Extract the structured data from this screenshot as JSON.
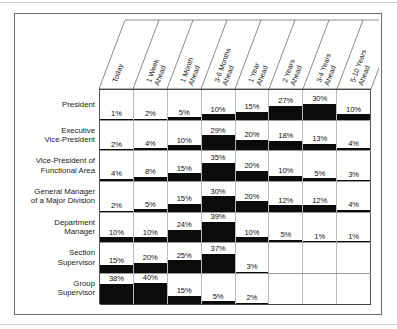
{
  "chart_data": {
    "type": "bar",
    "title": "",
    "xlabel": "",
    "ylabel": "",
    "grid": true,
    "legend": "none",
    "unit": "%",
    "ylim": [
      0,
      40
    ],
    "categories": [
      "Today",
      "1 Week Ahead",
      "1 Month Ahead",
      "3-6 Months Ahead",
      "1 Year Ahead",
      "2 Years Ahead",
      "3-4 Years Ahead",
      "5-10 Years Ahead"
    ],
    "series": [
      {
        "name": "President",
        "values": [
          1,
          2,
          5,
          10,
          15,
          27,
          30,
          10
        ],
        "labels": [
          "1%",
          "2%",
          "5%",
          "10%",
          "15%",
          "27%",
          "30%",
          "10%"
        ]
      },
      {
        "name": "Executive Vice-President",
        "values": [
          2,
          4,
          10,
          29,
          20,
          18,
          13,
          4
        ],
        "labels": [
          "2%",
          "4%",
          "10%",
          "29%",
          "20%",
          "18%",
          "13%",
          "4%"
        ]
      },
      {
        "name": "Vice-President of Functional Area",
        "values": [
          4,
          8,
          15,
          35,
          20,
          10,
          5,
          3
        ],
        "labels": [
          "4%",
          "8%",
          "15%",
          "35%",
          "20%",
          "10%",
          "5%",
          "3%"
        ]
      },
      {
        "name": "General Manager of a Major Division",
        "values": [
          2,
          5,
          15,
          30,
          20,
          12,
          12,
          4
        ],
        "labels": [
          "2%",
          "5%",
          "15%",
          "30%",
          "20%",
          "12%",
          "12%",
          "4%"
        ]
      },
      {
        "name": "Department Manager",
        "values": [
          10,
          10,
          24,
          39,
          10,
          5,
          1,
          1
        ],
        "labels": [
          "10%",
          "10%",
          "24%",
          "39%",
          "10%",
          "5%",
          "1%",
          "1%"
        ]
      },
      {
        "name": "Section Supervisor",
        "values": [
          15,
          20,
          25,
          37,
          3,
          null,
          null,
          null
        ],
        "labels": [
          "15%",
          "20%",
          "25%",
          "37%",
          "3%",
          "",
          "",
          ""
        ]
      },
      {
        "name": "Group Supervisor",
        "values": [
          38,
          40,
          15,
          5,
          2,
          null,
          null,
          null
        ],
        "labels": [
          "38%",
          "40%",
          "15%",
          "5%",
          "2%",
          "",
          "",
          ""
        ]
      }
    ],
    "row_labels": [
      [
        "President"
      ],
      [
        "Executive",
        "Vice-President"
      ],
      [
        "Vice-President of",
        "Functional Area"
      ],
      [
        "General Manager",
        "of a Major Division"
      ],
      [
        "Department",
        "Manager"
      ],
      [
        "Section",
        "Supervisor"
      ],
      [
        "Group",
        "Supervisor"
      ]
    ],
    "colors": {
      "bar": "#0b0b0b",
      "background": "#ffffff",
      "frame": "#6b6b6b",
      "gridline": "#b9b9b9",
      "text": "#1a1a1a"
    }
  }
}
